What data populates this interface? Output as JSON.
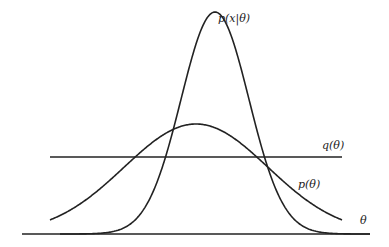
{
  "diagram": {
    "labels": {
      "likelihood": "p(x|θ)",
      "uniform": "q(θ)",
      "prior": "p(θ)",
      "axis": "θ"
    },
    "colors": {
      "stroke": "#222222",
      "background": "#ffffff"
    }
  }
}
